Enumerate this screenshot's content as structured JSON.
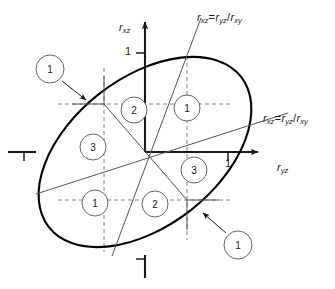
{
  "figure": {
    "type": "technical-diagram"
  },
  "axes": {
    "vertical": {
      "label_base": "r",
      "label_sub": "xz",
      "tick_positive": "1",
      "tick_negative": ""
    },
    "horizontal": {
      "label_base": "r",
      "label_sub": "yz",
      "tick_positive": "1",
      "tick_negative": ""
    }
  },
  "formula_labels": [
    {
      "id": "steep-line-label",
      "lhs_base": "r",
      "lhs_sub": "xz",
      "operator": "=",
      "num_base": "r",
      "num_sub": "yz",
      "divider": "/",
      "den_base": "r",
      "den_sub": "xy"
    },
    {
      "id": "shallow-line-label",
      "lhs_base": "r",
      "lhs_sub": "xz",
      "operator": "=",
      "num_base": "r",
      "num_sub": "yz",
      "divider": "/",
      "den_base": "r",
      "den_sub": "xy"
    }
  ],
  "sectors": [
    {
      "id": "sector-upper-left",
      "value": "2"
    },
    {
      "id": "sector-upper-right",
      "value": "1"
    },
    {
      "id": "sector-left",
      "value": "3"
    },
    {
      "id": "sector-right",
      "value": "3"
    },
    {
      "id": "sector-lower-left",
      "value": "1"
    },
    {
      "id": "sector-lower-right",
      "value": "2"
    }
  ],
  "callouts": [
    {
      "id": "callout-upper-left",
      "value": "1"
    },
    {
      "id": "callout-lower-right",
      "value": "1"
    }
  ],
  "colors": {
    "stroke": "#1a1a1a",
    "ellipse": "#000000",
    "sector_line": "#555555",
    "dashed": "#777777",
    "background": "#ffffff"
  }
}
